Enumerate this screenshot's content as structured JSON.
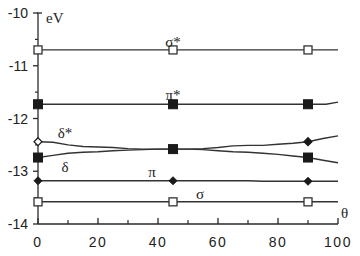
{
  "chart_data": {
    "type": "line",
    "title": "",
    "xlabel": "θ",
    "ylabel": "eV",
    "xlim": [
      0,
      100
    ],
    "ylim": [
      -14,
      -10
    ],
    "grid": false,
    "legend": "none (curves labeled inline)",
    "x_ticks": [
      0,
      20,
      40,
      60,
      80,
      100
    ],
    "x_minor_ticks": [
      10,
      30,
      50,
      70,
      90
    ],
    "y_ticks": [
      -10,
      -11,
      -12,
      -13,
      -14
    ],
    "y_minor_ticks": [
      -10.5,
      -11.5,
      -12.5,
      -13.5
    ],
    "series": [
      {
        "name": "σ*",
        "marker": "open-square",
        "marker_x": [
          0,
          45,
          90
        ],
        "x": [
          0,
          45,
          90,
          100
        ],
        "values": [
          -10.7,
          -10.7,
          -10.7,
          -10.7
        ],
        "label_pos": [
          45,
          -10.55
        ]
      },
      {
        "name": "π*",
        "marker": "filled-square",
        "marker_x": [
          0,
          45,
          90
        ],
        "x": [
          0,
          45,
          90,
          96,
          100
        ],
        "values": [
          -11.73,
          -11.73,
          -11.73,
          -11.73,
          -11.69
        ],
        "label_pos": [
          45,
          -11.55
        ]
      },
      {
        "name": "δ*",
        "marker": "open-diamond",
        "marker_x": [
          0,
          45,
          90
        ],
        "x": [
          0,
          5,
          10,
          15,
          20,
          25,
          30,
          35,
          40,
          45,
          50,
          55,
          60,
          65,
          70,
          75,
          80,
          85,
          90,
          95,
          100
        ],
        "values": [
          -12.44,
          -12.45,
          -12.5,
          -12.53,
          -12.54,
          -12.55,
          -12.57,
          -12.58,
          -12.58,
          -12.58,
          -12.58,
          -12.57,
          -12.55,
          -12.52,
          -12.51,
          -12.51,
          -12.49,
          -12.47,
          -12.44,
          -12.38,
          -12.33
        ],
        "label_pos": [
          9,
          -12.27
        ]
      },
      {
        "name": "δ",
        "marker": "filled-square",
        "marker_x": [
          0,
          45,
          90
        ],
        "x": [
          0,
          5,
          10,
          15,
          20,
          25,
          30,
          35,
          40,
          45,
          50,
          55,
          60,
          65,
          70,
          75,
          80,
          85,
          90,
          95,
          100
        ],
        "values": [
          -12.74,
          -12.7,
          -12.66,
          -12.64,
          -12.63,
          -12.61,
          -12.6,
          -12.59,
          -12.58,
          -12.58,
          -12.58,
          -12.59,
          -12.61,
          -12.63,
          -12.64,
          -12.66,
          -12.68,
          -12.71,
          -12.74,
          -12.79,
          -12.84
        ],
        "label_pos": [
          9,
          -12.92
        ]
      },
      {
        "name": "π",
        "marker": "filled-diamond",
        "marker_x": [
          0,
          45,
          90
        ],
        "x": [
          0,
          45,
          70,
          75,
          90,
          100
        ],
        "values": [
          -13.18,
          -13.18,
          -13.18,
          -13.19,
          -13.19,
          -13.19
        ],
        "label_pos": [
          38,
          -13.02
        ]
      },
      {
        "name": "σ",
        "marker": "open-square",
        "marker_x": [
          0,
          45,
          90
        ],
        "x": [
          0,
          45,
          90,
          100
        ],
        "values": [
          -13.58,
          -13.58,
          -13.58,
          -13.58
        ],
        "label_pos": [
          54,
          -13.43
        ]
      }
    ]
  }
}
